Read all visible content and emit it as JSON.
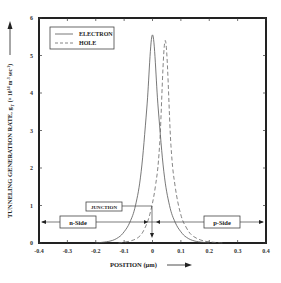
{
  "chart_data": {
    "type": "line",
    "title": "",
    "xlabel": "POSITION (µm)",
    "ylabel": "TUNNELING GENERATION RATE, g_T (× 10^14 m^-3 sec^-1)",
    "xlim": [
      -0.4,
      0.4
    ],
    "ylim": [
      0,
      6
    ],
    "xticks": [
      "-0.4",
      "-0.3",
      "-0.2",
      "-0.1",
      "0",
      "0.1",
      "0.2",
      "0.3",
      "0.4"
    ],
    "yticks": [
      "0",
      "1",
      "2",
      "3",
      "4",
      "5",
      "6"
    ],
    "grid": false,
    "legend_position": "upper left",
    "series": [
      {
        "name": "ELECTRON",
        "style": "solid",
        "x": [
          -0.2,
          -0.15,
          -0.12,
          -0.1,
          -0.08,
          -0.06,
          -0.04,
          -0.02,
          0.0,
          0.02,
          0.04,
          0.06,
          0.08,
          0.1,
          0.12,
          0.15,
          0.2
        ],
        "values": [
          0.0,
          0.05,
          0.15,
          0.3,
          0.55,
          1.0,
          1.9,
          3.6,
          5.55,
          3.6,
          1.9,
          1.0,
          0.55,
          0.3,
          0.15,
          0.05,
          0.0
        ]
      },
      {
        "name": "HOLE",
        "style": "dashed",
        "x": [
          -0.12,
          -0.08,
          -0.05,
          -0.03,
          -0.01,
          0.01,
          0.025,
          0.045,
          0.065,
          0.08,
          0.1,
          0.12,
          0.14,
          0.17,
          0.2,
          0.25
        ],
        "values": [
          0.0,
          0.05,
          0.15,
          0.35,
          0.75,
          1.5,
          2.6,
          5.4,
          2.6,
          1.5,
          0.75,
          0.4,
          0.2,
          0.08,
          0.03,
          0.0
        ]
      }
    ],
    "annotations": [
      {
        "text": "JUNCTION",
        "x": 0.0,
        "arrow": "down"
      },
      {
        "text": "n-Side",
        "region": [
          -0.4,
          0.0
        ],
        "arrow": "left"
      },
      {
        "text": "p-Side",
        "region": [
          0.0,
          0.4
        ],
        "arrow": "right"
      }
    ]
  },
  "labels": {
    "xlabel": "POSITION (µm)",
    "ylabel": "TUNNELING GENERATION RATE, g",
    "ylabel_sub": "T",
    "ylabel_units": "(× 10",
    "ylabel_exp": "14",
    "ylabel_units2": " m",
    "ylabel_exp2": "-3",
    "ylabel_units3": "sec",
    "ylabel_exp3": "-1",
    "ylabel_end": ")",
    "legend_electron": "ELECTRON",
    "legend_hole": "HOLE",
    "junction": "JUNCTION",
    "n_side": "n-Side",
    "p_side": "p-Side"
  },
  "colors": {
    "frame": "#222222",
    "electron": "#555555",
    "hole": "#666666",
    "text": "#222222"
  }
}
